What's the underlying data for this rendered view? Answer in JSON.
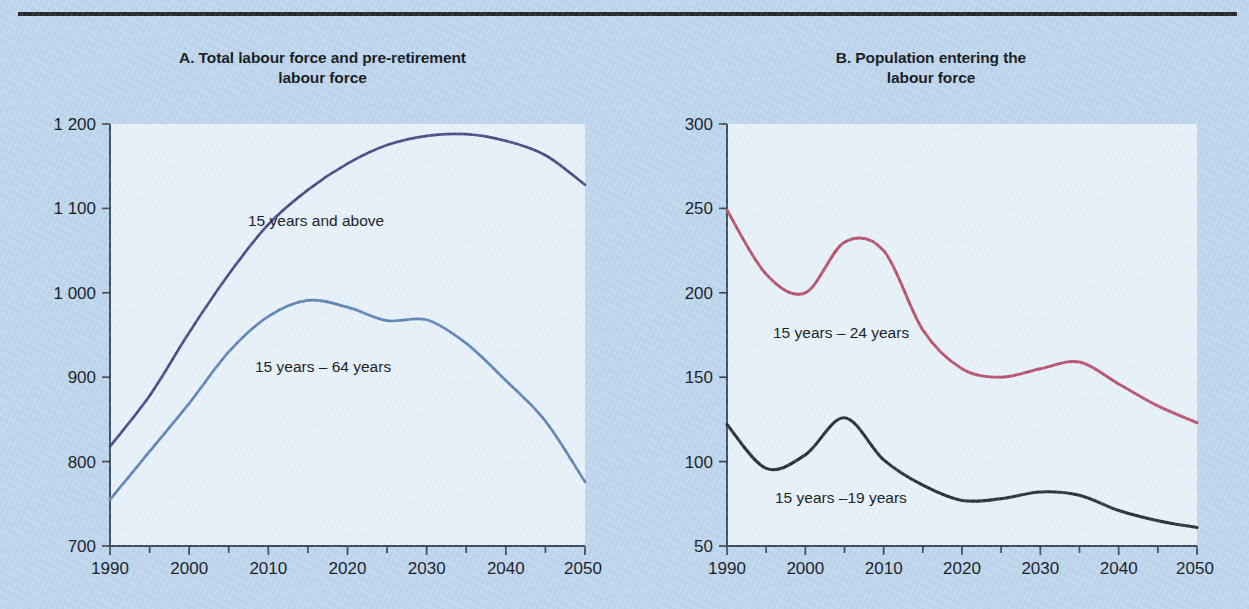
{
  "figure": {
    "background_color": "#bfd7ef",
    "plot_background_color": "#e9f3fb",
    "rule_color": "#22262c"
  },
  "panels": [
    {
      "id": "A",
      "title_line1": "A. Total labour force and pre-retirement",
      "title_line2": "labour force",
      "y_ticks": [
        "1 200",
        "1 100",
        "1 000",
        "900",
        "800",
        "700"
      ],
      "x_ticks": [
        "1990",
        "2000",
        "2010",
        "2020",
        "2030",
        "2040",
        "2050"
      ],
      "series_labels": [
        "15 years and above",
        "15 years – 64 years"
      ]
    },
    {
      "id": "B",
      "title_line1": "B. Population entering the",
      "title_line2": "labour force",
      "y_ticks": [
        "300",
        "250",
        "200",
        "150",
        "100",
        "50"
      ],
      "x_ticks": [
        "1990",
        "2000",
        "2010",
        "2020",
        "2030",
        "2040",
        "2050"
      ],
      "series_labels": [
        "15 years – 24 years",
        "15 years –19 years"
      ]
    }
  ],
  "chart_data": [
    {
      "type": "line",
      "panel": "A",
      "title": "A. Total labour force and pre-retirement labour force",
      "xlabel": "",
      "ylabel": "",
      "xlim": [
        1990,
        2050
      ],
      "ylim": [
        700,
        1200
      ],
      "yticks": [
        700,
        800,
        900,
        1000,
        1100,
        1200
      ],
      "ytick_labels": [
        "700",
        "800",
        "900",
        "1 000",
        "1 100",
        "1 200"
      ],
      "xticks": [
        1990,
        2000,
        2010,
        2020,
        2030,
        2040,
        2050
      ],
      "minor_xtick_step": 5,
      "grid": false,
      "legend": "inline-annotation",
      "x": [
        1990,
        1995,
        2000,
        2005,
        2010,
        2015,
        2020,
        2025,
        2030,
        2035,
        2040,
        2045,
        2050
      ],
      "series": [
        {
          "name": "15 years and above",
          "color": "#4a4d86",
          "values": [
            818,
            878,
            953,
            1022,
            1081,
            1122,
            1153,
            1175,
            1186,
            1188,
            1180,
            1163,
            1128
          ]
        },
        {
          "name": "15 years – 64 years",
          "color": "#5f86b8",
          "values": [
            755,
            812,
            869,
            930,
            972,
            991,
            983,
            967,
            968,
            940,
            896,
            848,
            776
          ]
        }
      ]
    },
    {
      "type": "line",
      "panel": "B",
      "title": "B. Population entering the labour force",
      "xlabel": "",
      "ylabel": "",
      "xlim": [
        1990,
        2050
      ],
      "ylim": [
        50,
        300
      ],
      "yticks": [
        50,
        100,
        150,
        200,
        250,
        300
      ],
      "ytick_labels": [
        "50",
        "100",
        "150",
        "200",
        "250",
        "300"
      ],
      "xticks": [
        1990,
        2000,
        2010,
        2020,
        2030,
        2040,
        2050
      ],
      "minor_xtick_step": 5,
      "grid": false,
      "legend": "inline-annotation",
      "x": [
        1990,
        1995,
        2000,
        2005,
        2010,
        2015,
        2020,
        2025,
        2030,
        2035,
        2040,
        2045,
        2050
      ],
      "series": [
        {
          "name": "15 years – 24 years",
          "color": "#b8536f",
          "values": [
            249,
            211,
            200,
            230,
            225,
            178,
            155,
            150,
            155,
            159,
            146,
            133,
            123
          ]
        },
        {
          "name": "15 years –19 years",
          "color": "#2c3138",
          "values": [
            122,
            96,
            104,
            126,
            101,
            86,
            77,
            78,
            82,
            80,
            71,
            65,
            61
          ]
        }
      ]
    }
  ]
}
